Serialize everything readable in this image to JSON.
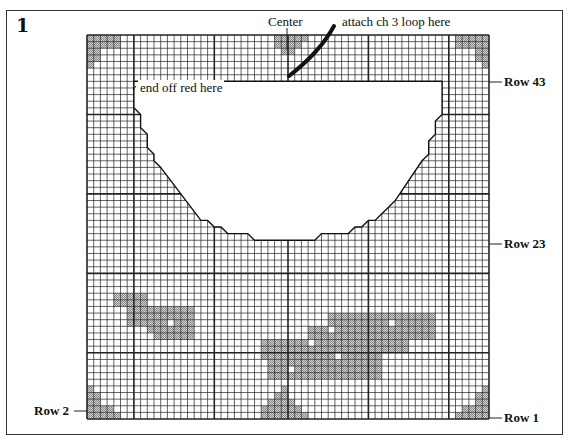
{
  "figure": {
    "number": "1",
    "labels": {
      "center": "Center",
      "attach": "attach ch 3 loop here",
      "end_off": "end off red here",
      "row43": "Row 43",
      "row23": "Row 23",
      "row2": "Row 2",
      "row1": "Row 1"
    }
  },
  "grid": {
    "cols": 60,
    "rows": 58,
    "heavy_cols": [
      7,
      19,
      30,
      42,
      54
    ],
    "heavy_rows": [
      12,
      24,
      36,
      48
    ],
    "shade_color": "#b8b8b8",
    "line_color": "#222222",
    "cutout_polygon": [
      [
        7,
        7
      ],
      [
        53,
        7
      ],
      [
        53,
        12
      ],
      [
        52,
        13
      ],
      [
        52,
        15
      ],
      [
        51,
        16
      ],
      [
        51,
        18
      ],
      [
        50,
        19
      ],
      [
        46,
        25
      ],
      [
        45,
        26
      ],
      [
        44,
        27
      ],
      [
        43,
        28
      ],
      [
        42,
        28
      ],
      [
        41,
        29
      ],
      [
        40,
        29
      ],
      [
        39,
        30
      ],
      [
        35,
        30
      ],
      [
        34,
        31
      ],
      [
        25,
        31
      ],
      [
        24,
        30
      ],
      [
        21,
        30
      ],
      [
        20,
        29
      ],
      [
        19,
        29
      ],
      [
        18,
        28
      ],
      [
        17,
        28
      ],
      [
        11,
        20
      ],
      [
        10,
        19
      ],
      [
        10,
        18
      ],
      [
        9,
        17
      ],
      [
        9,
        15
      ],
      [
        8,
        14
      ],
      [
        8,
        12
      ],
      [
        7,
        11
      ]
    ],
    "shaded_cells": {
      "top_left": [
        [
          0,
          0
        ],
        [
          1,
          0
        ],
        [
          2,
          0
        ],
        [
          3,
          0
        ],
        [
          4,
          0
        ],
        [
          0,
          1
        ],
        [
          1,
          1
        ],
        [
          2,
          1
        ],
        [
          3,
          1
        ],
        [
          4,
          1
        ],
        [
          0,
          2
        ],
        [
          1,
          2
        ],
        [
          0,
          3
        ],
        [
          1,
          3
        ],
        [
          0,
          4
        ]
      ],
      "top_right": [
        [
          55,
          0
        ],
        [
          56,
          0
        ],
        [
          57,
          0
        ],
        [
          58,
          0
        ],
        [
          59,
          0
        ],
        [
          55,
          1
        ],
        [
          56,
          1
        ],
        [
          57,
          1
        ],
        [
          58,
          1
        ],
        [
          59,
          1
        ],
        [
          58,
          2
        ],
        [
          59,
          2
        ],
        [
          58,
          3
        ],
        [
          59,
          3
        ],
        [
          59,
          4
        ]
      ],
      "top_center": [
        [
          28,
          0
        ],
        [
          29,
          0
        ],
        [
          30,
          0
        ],
        [
          31,
          0
        ],
        [
          32,
          0
        ],
        [
          28,
          1
        ],
        [
          29,
          1
        ],
        [
          30,
          1
        ],
        [
          31,
          1
        ],
        [
          29,
          2
        ],
        [
          30,
          2
        ]
      ],
      "bottom_left": [
        [
          0,
          53
        ],
        [
          0,
          54
        ],
        [
          1,
          54
        ],
        [
          0,
          55
        ],
        [
          1,
          55
        ],
        [
          0,
          56
        ],
        [
          1,
          56
        ],
        [
          2,
          56
        ],
        [
          3,
          56
        ],
        [
          0,
          57
        ],
        [
          1,
          57
        ],
        [
          2,
          57
        ],
        [
          3,
          57
        ],
        [
          4,
          57
        ]
      ],
      "bottom_right": [
        [
          59,
          53
        ],
        [
          58,
          54
        ],
        [
          59,
          54
        ],
        [
          58,
          55
        ],
        [
          59,
          55
        ],
        [
          56,
          56
        ],
        [
          57,
          56
        ],
        [
          58,
          56
        ],
        [
          59,
          56
        ],
        [
          55,
          57
        ],
        [
          56,
          57
        ],
        [
          57,
          57
        ],
        [
          58,
          57
        ],
        [
          59,
          57
        ]
      ],
      "bottom_center": [
        [
          29,
          53
        ],
        [
          28,
          54
        ],
        [
          29,
          54
        ],
        [
          27,
          55
        ],
        [
          28,
          55
        ],
        [
          29,
          55
        ],
        [
          30,
          55
        ],
        [
          26,
          56
        ],
        [
          27,
          56
        ],
        [
          28,
          56
        ],
        [
          29,
          56
        ],
        [
          30,
          56
        ],
        [
          31,
          56
        ],
        [
          26,
          57
        ],
        [
          27,
          57
        ],
        [
          28,
          57
        ],
        [
          29,
          57
        ],
        [
          30,
          57
        ],
        [
          31,
          57
        ],
        [
          32,
          57
        ]
      ],
      "motif_left": [
        [
          4,
          39
        ],
        [
          5,
          39
        ],
        [
          6,
          39
        ],
        [
          7,
          39
        ],
        [
          8,
          39
        ],
        [
          4,
          40
        ],
        [
          5,
          40
        ],
        [
          6,
          40
        ],
        [
          7,
          40
        ],
        [
          8,
          40
        ],
        [
          6,
          41
        ],
        [
          7,
          41
        ],
        [
          8,
          41
        ],
        [
          9,
          41
        ],
        [
          10,
          41
        ],
        [
          11,
          41
        ],
        [
          12,
          41
        ],
        [
          13,
          41
        ],
        [
          14,
          41
        ],
        [
          15,
          41
        ],
        [
          6,
          42
        ],
        [
          7,
          42
        ],
        [
          8,
          42
        ],
        [
          9,
          42
        ],
        [
          10,
          42
        ],
        [
          11,
          42
        ],
        [
          12,
          42
        ],
        [
          13,
          42
        ],
        [
          14,
          42
        ],
        [
          15,
          42
        ],
        [
          6,
          43
        ],
        [
          7,
          43
        ],
        [
          8,
          43
        ],
        [
          9,
          43
        ],
        [
          10,
          43
        ],
        [
          11,
          43
        ],
        [
          13,
          43
        ],
        [
          14,
          43
        ],
        [
          15,
          43
        ],
        [
          9,
          44
        ],
        [
          10,
          44
        ],
        [
          11,
          44
        ],
        [
          12,
          44
        ],
        [
          13,
          44
        ],
        [
          14,
          44
        ],
        [
          15,
          44
        ],
        [
          10,
          45
        ],
        [
          11,
          45
        ],
        [
          12,
          45
        ],
        [
          13,
          45
        ],
        [
          14,
          45
        ],
        [
          15,
          45
        ]
      ],
      "motif_right": [
        [
          36,
          42
        ],
        [
          37,
          42
        ],
        [
          38,
          42
        ],
        [
          39,
          42
        ],
        [
          40,
          42
        ],
        [
          41,
          42
        ],
        [
          42,
          42
        ],
        [
          43,
          42
        ],
        [
          44,
          42
        ],
        [
          45,
          42
        ],
        [
          46,
          42
        ],
        [
          47,
          42
        ],
        [
          48,
          42
        ],
        [
          49,
          42
        ],
        [
          50,
          42
        ],
        [
          51,
          42
        ],
        [
          36,
          43
        ],
        [
          37,
          43
        ],
        [
          38,
          43
        ],
        [
          39,
          43
        ],
        [
          40,
          43
        ],
        [
          41,
          43
        ],
        [
          42,
          43
        ],
        [
          43,
          43
        ],
        [
          44,
          43
        ],
        [
          46,
          43
        ],
        [
          47,
          43
        ],
        [
          48,
          43
        ],
        [
          49,
          43
        ],
        [
          50,
          43
        ],
        [
          51,
          43
        ],
        [
          33,
          44
        ],
        [
          34,
          44
        ],
        [
          35,
          44
        ],
        [
          37,
          44
        ],
        [
          38,
          44
        ],
        [
          39,
          44
        ],
        [
          40,
          44
        ],
        [
          41,
          44
        ],
        [
          42,
          44
        ],
        [
          43,
          44
        ],
        [
          44,
          44
        ],
        [
          45,
          44
        ],
        [
          46,
          44
        ],
        [
          47,
          44
        ],
        [
          48,
          44
        ],
        [
          49,
          44
        ],
        [
          50,
          44
        ],
        [
          51,
          44
        ],
        [
          33,
          45
        ],
        [
          34,
          45
        ],
        [
          35,
          45
        ],
        [
          36,
          45
        ],
        [
          37,
          45
        ],
        [
          38,
          45
        ],
        [
          39,
          45
        ],
        [
          40,
          45
        ],
        [
          41,
          45
        ],
        [
          42,
          45
        ],
        [
          43,
          45
        ],
        [
          44,
          45
        ],
        [
          45,
          45
        ],
        [
          46,
          45
        ],
        [
          47,
          45
        ],
        [
          48,
          45
        ],
        [
          49,
          45
        ],
        [
          50,
          45
        ],
        [
          51,
          45
        ],
        [
          26,
          46
        ],
        [
          27,
          46
        ],
        [
          28,
          46
        ],
        [
          29,
          46
        ],
        [
          30,
          46
        ],
        [
          31,
          46
        ],
        [
          32,
          46
        ],
        [
          34,
          46
        ],
        [
          35,
          46
        ],
        [
          36,
          46
        ],
        [
          37,
          46
        ],
        [
          38,
          46
        ],
        [
          39,
          46
        ],
        [
          40,
          46
        ],
        [
          41,
          46
        ],
        [
          42,
          46
        ],
        [
          43,
          46
        ],
        [
          44,
          46
        ],
        [
          45,
          46
        ],
        [
          46,
          46
        ],
        [
          47,
          46
        ],
        [
          26,
          47
        ],
        [
          27,
          47
        ],
        [
          28,
          47
        ],
        [
          29,
          47
        ],
        [
          30,
          47
        ],
        [
          31,
          47
        ],
        [
          32,
          47
        ],
        [
          33,
          47
        ],
        [
          34,
          47
        ],
        [
          35,
          47
        ],
        [
          36,
          47
        ],
        [
          37,
          47
        ],
        [
          38,
          47
        ],
        [
          39,
          47
        ],
        [
          40,
          47
        ],
        [
          41,
          47
        ],
        [
          42,
          47
        ],
        [
          43,
          47
        ],
        [
          44,
          47
        ],
        [
          45,
          47
        ],
        [
          46,
          47
        ],
        [
          47,
          47
        ],
        [
          26,
          48
        ],
        [
          27,
          48
        ],
        [
          28,
          48
        ],
        [
          29,
          48
        ],
        [
          30,
          48
        ],
        [
          31,
          48
        ],
        [
          32,
          48
        ],
        [
          33,
          48
        ],
        [
          34,
          48
        ],
        [
          35,
          48
        ],
        [
          36,
          48
        ],
        [
          38,
          48
        ],
        [
          39,
          48
        ],
        [
          40,
          48
        ],
        [
          41,
          48
        ],
        [
          42,
          48
        ],
        [
          43,
          48
        ],
        [
          27,
          49
        ],
        [
          28,
          49
        ],
        [
          29,
          49
        ],
        [
          30,
          49
        ],
        [
          31,
          49
        ],
        [
          32,
          49
        ],
        [
          33,
          49
        ],
        [
          34,
          49
        ],
        [
          35,
          49
        ],
        [
          36,
          49
        ],
        [
          37,
          49
        ],
        [
          38,
          49
        ],
        [
          39,
          49
        ],
        [
          40,
          49
        ],
        [
          41,
          49
        ],
        [
          42,
          49
        ],
        [
          43,
          49
        ],
        [
          27,
          50
        ],
        [
          28,
          50
        ],
        [
          29,
          50
        ],
        [
          31,
          50
        ],
        [
          32,
          50
        ],
        [
          33,
          50
        ],
        [
          34,
          50
        ],
        [
          35,
          50
        ],
        [
          36,
          50
        ],
        [
          37,
          50
        ],
        [
          38,
          50
        ],
        [
          39,
          50
        ],
        [
          40,
          50
        ],
        [
          41,
          50
        ],
        [
          42,
          50
        ],
        [
          43,
          50
        ],
        [
          27,
          51
        ],
        [
          28,
          51
        ],
        [
          29,
          51
        ],
        [
          30,
          51
        ],
        [
          31,
          51
        ],
        [
          32,
          51
        ],
        [
          33,
          51
        ],
        [
          34,
          51
        ],
        [
          35,
          51
        ],
        [
          36,
          51
        ],
        [
          37,
          51
        ],
        [
          38,
          51
        ],
        [
          39,
          51
        ],
        [
          40,
          51
        ],
        [
          41,
          51
        ],
        [
          42,
          51
        ],
        [
          43,
          51
        ]
      ]
    }
  }
}
